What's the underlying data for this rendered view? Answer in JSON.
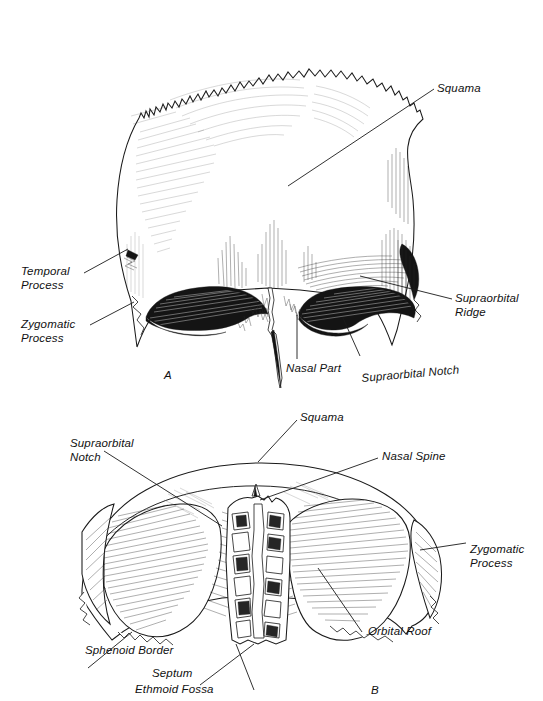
{
  "plate": {
    "background_color": "#ffffff",
    "ink_color": "#1a1a1a",
    "description": "Two-panel anatomical line drawing of the frontal bone of the skull"
  },
  "figures": [
    {
      "id": "A",
      "letter": "A",
      "view": "anterior (external) surface of the frontal bone",
      "labels": [
        {
          "key": "squama",
          "text": "Squama"
        },
        {
          "key": "temporal_process",
          "text": "Temporal\nProcess"
        },
        {
          "key": "zygomatic_process",
          "text": "Zygomatic\nProcess"
        },
        {
          "key": "supraorbital_ridge",
          "text": "Supraorbital\nRidge"
        },
        {
          "key": "nasal_part",
          "text": "Nasal Part"
        },
        {
          "key": "supraorbital_notch",
          "text": "Supraorbital Notch"
        }
      ]
    },
    {
      "id": "B",
      "letter": "B",
      "view": "inferior (orbital) surface of the frontal bone",
      "labels": [
        {
          "key": "squama",
          "text": "Squama"
        },
        {
          "key": "supraorbital_notch",
          "text": "Supraorbital\nNotch"
        },
        {
          "key": "nasal_spine",
          "text": "Nasal Spine"
        },
        {
          "key": "zygomatic_process",
          "text": "Zygomatic\nProcess"
        },
        {
          "key": "orbital_roof",
          "text": "Orbital Roof"
        },
        {
          "key": "sphenoid_border",
          "text": "Sphenoid Border"
        },
        {
          "key": "septum",
          "text": "Septum"
        },
        {
          "key": "ethmoid_fossa",
          "text": "Ethmoid Fossa"
        }
      ]
    }
  ]
}
